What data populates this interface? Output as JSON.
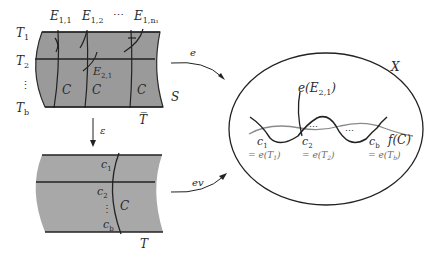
{
  "top_surface": {
    "row_labels": [
      "T",
      "T",
      "⋮",
      "T"
    ],
    "row_subs": [
      "1",
      "2",
      "",
      "b"
    ],
    "top_labels": [
      {
        "main": "E",
        "sub": "1,1"
      },
      {
        "main": "E",
        "sub": "1,2"
      },
      {
        "main": "⋯",
        "sub": ""
      },
      {
        "main": "E",
        "sub": "1,n₁"
      }
    ],
    "inner_label": {
      "main": "E",
      "sub": "2,1"
    },
    "curve_labels": [
      "C",
      "C",
      "C"
    ],
    "surface_label": "S",
    "bottom_label": "T̅"
  },
  "bottom_surface": {
    "point_labels": [
      {
        "main": "c",
        "sub": "1"
      },
      {
        "main": "c",
        "sub": "2"
      },
      {
        "main": "⋮",
        "sub": ""
      },
      {
        "main": "c",
        "sub": "b"
      }
    ],
    "curve_label": "C",
    "bottom_label": "T"
  },
  "arrows": {
    "down": "ε",
    "top_right": "e",
    "bottom_right": "ev"
  },
  "target_space": {
    "label": "X",
    "curve_image_label": "e(E",
    "curve_image_sub": "2,1",
    "fc_label": "f(C)",
    "points": [
      {
        "main": "c",
        "sub": "1",
        "eq": "= e(T",
        "eq_sub": "1"
      },
      {
        "main": "c",
        "sub": "2",
        "eq": "= e(T",
        "eq_sub": "2"
      },
      {
        "main": "c",
        "sub": "b",
        "eq": "= e(T",
        "eq_sub": "b"
      }
    ],
    "dots": "⋯"
  }
}
